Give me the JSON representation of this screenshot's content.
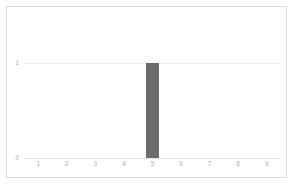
{
  "chart_data": {
    "type": "bar",
    "title": "",
    "subtitle": "",
    "xlabel": "",
    "ylabel": "",
    "categories": [
      "1",
      "2",
      "3",
      "4",
      "5",
      "6",
      "7",
      "8",
      "9"
    ],
    "values": [
      0,
      0,
      0,
      0,
      1,
      0,
      0,
      0,
      0
    ],
    "series": [
      {
        "name": "",
        "values": [
          0,
          0,
          0,
          0,
          1,
          0,
          0,
          0,
          0
        ]
      }
    ],
    "xlim": [
      0.5,
      9.5
    ],
    "ylim": [
      0,
      1
    ],
    "yticks": [
      "0",
      "1"
    ],
    "ytick_values": [
      0,
      1
    ],
    "xticks": [
      "1",
      "2",
      "3",
      "4",
      "5",
      "6",
      "7",
      "8",
      "9"
    ],
    "grid": true,
    "legend": false,
    "legend_position": "none",
    "annotations": [],
    "colors": {
      "bar": "#6b6b6b",
      "gridline": "#ededed",
      "baseline": "#e6e6e6",
      "frame_border": "#dcdcdc",
      "tick_label": "#b4b4b4",
      "background": "#ffffff"
    }
  },
  "axis": {
    "y": {
      "ticks": [
        {
          "label": "1",
          "value": 1
        },
        {
          "label": "0",
          "value": 0
        }
      ]
    },
    "x": {
      "ticks": [
        {
          "label": "1",
          "value": 1
        },
        {
          "label": "2",
          "value": 2
        },
        {
          "label": "3",
          "value": 3
        },
        {
          "label": "4",
          "value": 4
        },
        {
          "label": "5",
          "value": 5
        },
        {
          "label": "6",
          "value": 6
        },
        {
          "label": "7",
          "value": 7
        },
        {
          "label": "8",
          "value": 8
        },
        {
          "label": "9",
          "value": 9
        }
      ]
    }
  }
}
